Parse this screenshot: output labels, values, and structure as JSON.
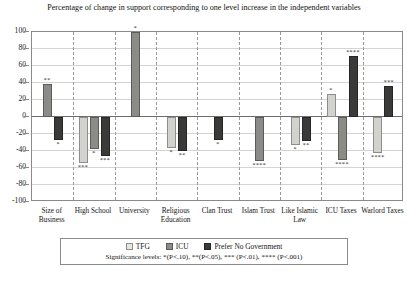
{
  "chart_data": {
    "type": "bar",
    "title": "Percentage of change in support corresponding to one level increase in the independent variables",
    "xlabel": "",
    "ylabel": "",
    "ylim": [
      -100,
      100
    ],
    "yticks": [
      100,
      80,
      60,
      40,
      20,
      0,
      -20,
      -40,
      -60,
      -80,
      -100
    ],
    "grid": true,
    "legend_position": "bottom",
    "categories": [
      "Size of Business",
      "High School",
      "University",
      "Religious Education",
      "Clan Trust",
      "Islam Trust",
      "Like Islamic Law",
      "ICU Taxes",
      "Warlord Taxes"
    ],
    "series": [
      {
        "name": "TFG",
        "color": "#d2d2cf",
        "values": [
          null,
          -54,
          null,
          -36,
          null,
          null,
          -33,
          27,
          -42
        ],
        "significance": [
          null,
          "***",
          null,
          "*",
          null,
          null,
          "*",
          "*",
          "****"
        ]
      },
      {
        "name": "ICU",
        "color": "#8b8b88",
        "values": [
          39,
          -38,
          100,
          null,
          null,
          -52,
          null,
          -50,
          null
        ],
        "significance": [
          "**",
          "*",
          "*",
          null,
          null,
          "****",
          null,
          "****",
          null
        ]
      },
      {
        "name": "Prefer No Government",
        "color": "#3a3a38",
        "values": [
          -27,
          -46,
          null,
          -40,
          -27,
          null,
          -28,
          72,
          36
        ],
        "significance": [
          "*",
          "***",
          null,
          "**",
          "*",
          null,
          "**",
          "****",
          "***"
        ]
      }
    ],
    "significance_note": "Significance levels: *(P<.10), **(P<.05), *** (P<.01), **** (P<.001)"
  }
}
